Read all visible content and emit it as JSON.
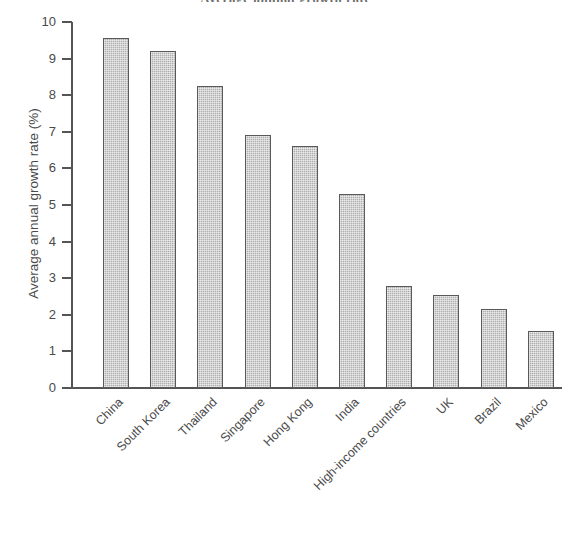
{
  "chart_data": {
    "type": "bar",
    "title": "Average annual growth rate",
    "xlabel": "",
    "ylabel": "Average annual growth rate (%)",
    "ylim": [
      0,
      10
    ],
    "yticks": [
      "0",
      "1",
      "2",
      "3",
      "4",
      "5",
      "6",
      "7",
      "8",
      "9",
      "10"
    ],
    "grid": false,
    "legend": "none",
    "categories": [
      "China",
      "South Korea",
      "Thailand",
      "Singapore",
      "Hong Kong",
      "India",
      "High-income countries",
      "UK",
      "Brazil",
      "Mexico"
    ],
    "values": [
      9.55,
      9.2,
      8.25,
      6.9,
      6.6,
      5.3,
      2.8,
      2.55,
      2.15,
      1.55
    ],
    "bar_fill_color": "#aeaeae",
    "bar_edge_color": "#5a5a5a",
    "axis_color": "#555555",
    "text_color": "#4a4a4a"
  }
}
